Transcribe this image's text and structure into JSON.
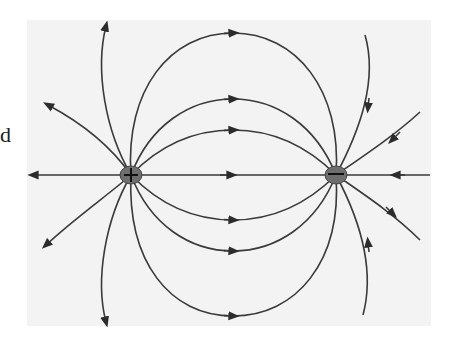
{
  "diagram": {
    "type": "electric-dipole-field-lines",
    "side_text": "d",
    "charges": [
      {
        "name": "positive-charge",
        "sign": "+",
        "cx": 131,
        "cy": 175
      },
      {
        "name": "negative-charge",
        "sign": "−",
        "cx": 336,
        "cy": 175
      }
    ],
    "colors": {
      "line": "#3a3a3a",
      "charge_fill": "#6e6e6e",
      "panel": "#f3f3f3",
      "background": "#ffffff"
    }
  }
}
